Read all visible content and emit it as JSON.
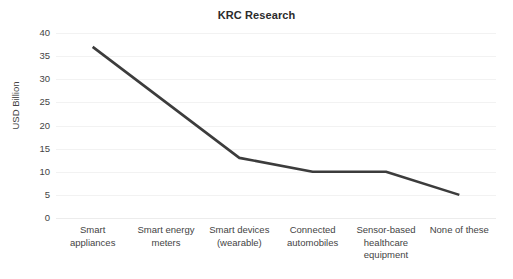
{
  "chart_data": {
    "type": "line",
    "title": "KRC Research",
    "xlabel": "",
    "ylabel": "USD Billion",
    "categories": [
      "Smart appliances",
      "Smart energy meters",
      "Smart devices (wearable)",
      "Connected automobiles",
      "Sensor-based healthcare equipment",
      "None of these"
    ],
    "category_lines": [
      [
        "Smart",
        "appliances"
      ],
      [
        "Smart energy",
        "meters"
      ],
      [
        "Smart devices",
        "(wearable)"
      ],
      [
        "Connected",
        "automobiles"
      ],
      [
        "Sensor-based",
        "healthcare",
        "equipment"
      ],
      [
        "None of these"
      ]
    ],
    "values": [
      37,
      25,
      13,
      10,
      10,
      5
    ],
    "ylim": [
      0,
      40
    ],
    "yticks": [
      0,
      5,
      10,
      15,
      20,
      25,
      30,
      35,
      40
    ],
    "ytick_labels": [
      "0",
      "5",
      "10",
      "15",
      "20",
      "25",
      "30",
      "35",
      "40"
    ],
    "grid": true,
    "grid_axis": "y",
    "legend": false,
    "legend_position": "none",
    "series_color": "#3c3c3c",
    "grid_color": "#f2f2f2",
    "text_color": "#444444",
    "title_color": "#2b2b2b",
    "background": "#ffffff",
    "line_width": 2.6
  }
}
